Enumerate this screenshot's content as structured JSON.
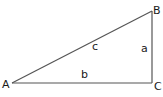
{
  "diagram": {
    "type": "right-triangle",
    "stroke_color": "#555555",
    "label_color": "#1a1a1a",
    "vertices": {
      "A": {
        "label": "A",
        "x": 12,
        "y": 83
      },
      "B": {
        "label": "B",
        "x": 152,
        "y": 11
      },
      "C": {
        "label": "C",
        "x": 152,
        "y": 83
      }
    },
    "sides": {
      "a": {
        "label": "a",
        "from": "B",
        "to": "C"
      },
      "b": {
        "label": "b",
        "from": "A",
        "to": "C"
      },
      "c": {
        "label": "c",
        "from": "A",
        "to": "B"
      }
    },
    "right_angle_at": "C"
  }
}
